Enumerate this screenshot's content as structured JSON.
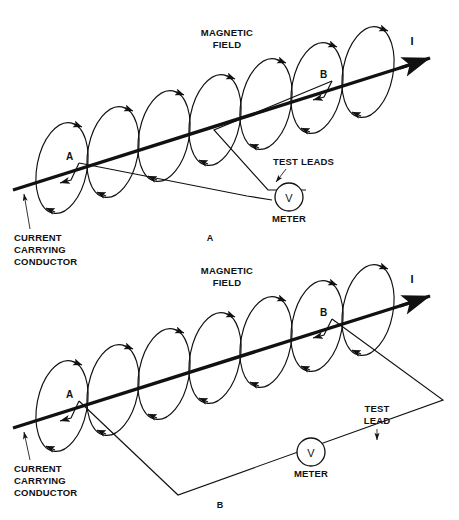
{
  "figure": {
    "title_implicit": "Magnetic field measurement around a current carrying conductor",
    "panels": [
      {
        "id": "panel-a",
        "caption": "A",
        "labels": {
          "magnetic_field": "MAGNETIC\nFIELD",
          "magnetic_field_line1": "MAGNETIC",
          "magnetic_field_line2": "FIELD",
          "current_symbol": "I",
          "point_a": "A",
          "point_b": "B",
          "test_leads": "TEST LEADS",
          "meter": "METER",
          "meter_symbol": "V",
          "conductor_line1": "CURRENT",
          "conductor_line2": "CARRYING",
          "conductor_line3": "CONDUCTOR"
        },
        "loop_count": 7,
        "lead_configuration": "two-leads-across-conductor"
      },
      {
        "id": "panel-b",
        "caption": "B",
        "labels": {
          "magnetic_field_line1": "MAGNETIC",
          "magnetic_field_line2": "FIELD",
          "current_symbol": "I",
          "point_a": "A",
          "point_b": "B",
          "test_lead_line1": "TEST",
          "test_lead_line2": "LEAD",
          "meter": "METER",
          "meter_symbol": "V",
          "conductor_line1": "CURRENT",
          "conductor_line2": "CARRYING",
          "conductor_line3": "CONDUCTOR"
        },
        "loop_count": 7,
        "lead_configuration": "large-loop-enclosing-area"
      }
    ],
    "colors": {
      "ink": "#111111",
      "background": "#ffffff"
    }
  }
}
